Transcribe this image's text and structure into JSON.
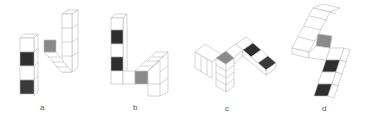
{
  "figure": {
    "colors": {
      "edge": "#b8b8b8",
      "face_white": "#ffffff",
      "face_dark": "#2e2e2e",
      "face_dark2": "#3a3a3a",
      "face_gray": "#8a8a8a",
      "label": "#555555"
    },
    "options": [
      {
        "label": "a"
      },
      {
        "label": "b"
      },
      {
        "label": "c"
      },
      {
        "label": "d"
      }
    ]
  }
}
